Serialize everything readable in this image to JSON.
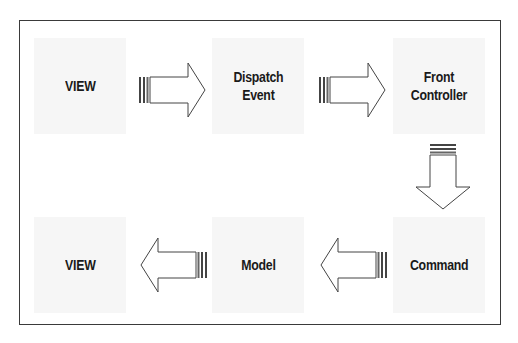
{
  "diagram": {
    "type": "flow",
    "nodes": [
      {
        "id": "view_top",
        "label": "VIEW"
      },
      {
        "id": "dispatch_event",
        "label": "Dispatch\nEvent"
      },
      {
        "id": "front_controller",
        "label": "Front\nController"
      },
      {
        "id": "command",
        "label": "Command"
      },
      {
        "id": "model",
        "label": "Model"
      },
      {
        "id": "view_bottom",
        "label": "VIEW"
      }
    ],
    "edges": [
      {
        "from": "view_top",
        "to": "dispatch_event",
        "direction": "right"
      },
      {
        "from": "dispatch_event",
        "to": "front_controller",
        "direction": "right"
      },
      {
        "from": "front_controller",
        "to": "command",
        "direction": "down"
      },
      {
        "from": "command",
        "to": "model",
        "direction": "left"
      },
      {
        "from": "model",
        "to": "view_bottom",
        "direction": "left"
      }
    ],
    "colors": {
      "border": "#3a3a3a",
      "node_bg": "#f6f6f6",
      "text": "#1a1a1a",
      "arrow_stroke": "#444444"
    }
  }
}
